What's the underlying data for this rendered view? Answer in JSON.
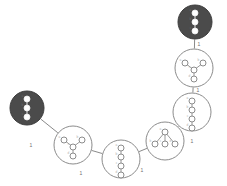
{
  "figure": {
    "title": "",
    "width": 227,
    "height": 186,
    "background": "#ffffff"
  },
  "palette": {
    "edge_stroke": "#8a8a8a",
    "node_outline_stroke": "#8c8c8c",
    "node_outline_fill": "#ffffff",
    "node_filled_fill": "#4b4b4b",
    "node_filled_stroke": "#3c3c3c",
    "inner_dot_fill": "#ffffff",
    "label_color": "#6e6e6e",
    "vertex_label_color": "#b0b0b0"
  },
  "chart_data": {
    "type": "diagram",
    "title": "",
    "nodes": [
      {
        "id": "n1",
        "cx": 27,
        "cy": 108,
        "r": 17,
        "style": "filled",
        "inner_graph": "path-3",
        "inner_vertices": [
          {
            "label": "a",
            "x": 0,
            "y": -9
          },
          {
            "label": "b",
            "x": 0,
            "y": 0
          },
          {
            "label": "c",
            "x": 0,
            "y": 9
          }
        ],
        "inner_edges": [
          [
            0,
            1
          ],
          [
            1,
            2
          ]
        ]
      },
      {
        "id": "n2",
        "cx": 73,
        "cy": 145,
        "r": 19,
        "style": "outline",
        "inner_graph": "star-3",
        "inner_vertices": [
          {
            "label": "a",
            "x": -9,
            "y": -5
          },
          {
            "label": "b",
            "x": 9,
            "y": -5
          },
          {
            "label": "c",
            "x": 0,
            "y": 2
          },
          {
            "label": "d",
            "x": 0,
            "y": 11
          }
        ],
        "inner_edges": [
          [
            0,
            2
          ],
          [
            1,
            2
          ],
          [
            2,
            3
          ]
        ]
      },
      {
        "id": "n3",
        "cx": 121,
        "cy": 159,
        "r": 19,
        "style": "outline",
        "inner_graph": "path-3",
        "inner_vertices": [
          {
            "label": "a",
            "x": 0,
            "y": -11
          },
          {
            "label": "b",
            "x": 0,
            "y": -2
          },
          {
            "label": "c",
            "x": 0,
            "y": 7
          },
          {
            "label": "d",
            "x": 0,
            "y": 16
          }
        ],
        "inner_edges": [
          [
            0,
            1
          ],
          [
            1,
            2
          ],
          [
            2,
            3
          ]
        ]
      },
      {
        "id": "n4",
        "cx": 165,
        "cy": 141,
        "r": 19,
        "style": "outline",
        "inner_graph": "star-3",
        "inner_vertices": [
          {
            "label": "a",
            "x": 0,
            "y": -9
          },
          {
            "label": "b",
            "x": -10,
            "y": 3
          },
          {
            "label": "c",
            "x": 0,
            "y": 3
          },
          {
            "label": "d",
            "x": 10,
            "y": 3
          }
        ],
        "inner_edges": [
          [
            0,
            1
          ],
          [
            0,
            2
          ],
          [
            0,
            3
          ]
        ]
      },
      {
        "id": "n5",
        "cx": 192,
        "cy": 112,
        "r": 19,
        "style": "outline",
        "inner_graph": "path-3",
        "inner_vertices": [
          {
            "label": "a",
            "x": 0,
            "y": -11
          },
          {
            "label": "b",
            "x": 0,
            "y": -2
          },
          {
            "label": "c",
            "x": 0,
            "y": 7
          },
          {
            "label": "d",
            "x": 0,
            "y": 16
          }
        ],
        "inner_edges": [
          [
            0,
            1
          ],
          [
            1,
            2
          ],
          [
            2,
            3
          ]
        ]
      },
      {
        "id": "n6",
        "cx": 194,
        "cy": 68,
        "r": 19,
        "style": "outline",
        "inner_graph": "star-3",
        "inner_vertices": [
          {
            "label": "a",
            "x": -9,
            "y": -5
          },
          {
            "label": "b",
            "x": 9,
            "y": -5
          },
          {
            "label": "c",
            "x": 0,
            "y": 2
          },
          {
            "label": "d",
            "x": 0,
            "y": 11
          }
        ],
        "inner_edges": [
          [
            0,
            2
          ],
          [
            1,
            2
          ],
          [
            2,
            3
          ]
        ]
      },
      {
        "id": "n7",
        "cx": 195,
        "cy": 22,
        "r": 17,
        "style": "filled",
        "inner_graph": "path-3",
        "inner_vertices": [
          {
            "label": "a",
            "x": 0,
            "y": -9
          },
          {
            "label": "b",
            "x": 0,
            "y": 0
          },
          {
            "label": "c",
            "x": 0,
            "y": 9
          }
        ],
        "inner_edges": [
          [
            0,
            1
          ],
          [
            1,
            2
          ]
        ]
      }
    ],
    "edges": [
      {
        "from": "n1",
        "to": "n2",
        "label": "1",
        "label_x": 31,
        "label_y": 147
      },
      {
        "from": "n2",
        "to": "n3",
        "label": "1",
        "label_x": 81,
        "label_y": 175
      },
      {
        "from": "n3",
        "to": "n4",
        "label": "1",
        "label_x": 142,
        "label_y": 172
      },
      {
        "from": "n4",
        "to": "n5",
        "label": "1",
        "label_x": 192,
        "label_y": 143
      },
      {
        "from": "n5",
        "to": "n6",
        "label": "1",
        "label_x": 198,
        "label_y": 92
      },
      {
        "from": "n6",
        "to": "n7",
        "label": "1",
        "label_x": 199,
        "label_y": 46
      }
    ],
    "edge_label_default": "1",
    "legend": [],
    "grid": false
  }
}
